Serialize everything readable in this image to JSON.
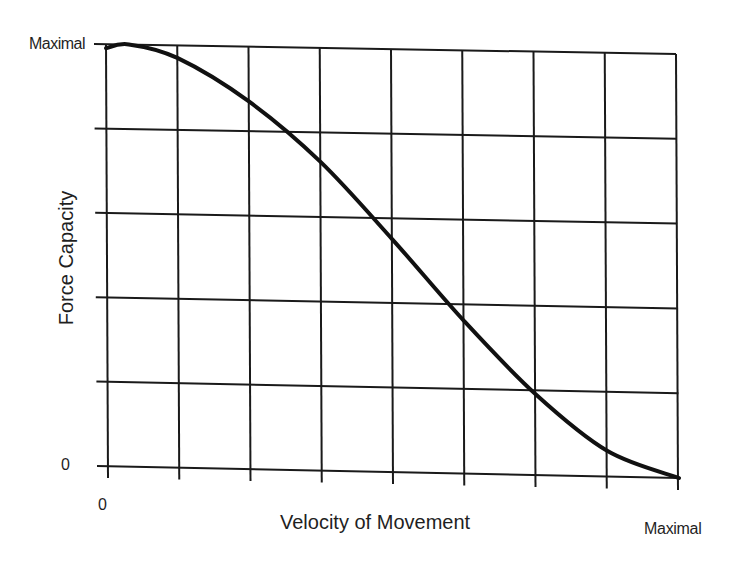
{
  "chart_data": {
    "type": "line",
    "title": "",
    "xlabel": "Velocity of Movement",
    "ylabel": "Force Capacity",
    "x_tick_labels": {
      "start": "0",
      "end": "Maximal"
    },
    "y_tick_labels": {
      "start": "0",
      "end": "Maximal"
    },
    "xlim": [
      0,
      1
    ],
    "ylim": [
      0,
      1
    ],
    "grid": true,
    "grid_divisions": {
      "x": 8,
      "y": 5
    },
    "legend": null,
    "series": [
      {
        "name": "Force-velocity relationship",
        "x": [
          0,
          0.125,
          0.25,
          0.375,
          0.5,
          0.625,
          0.75,
          0.875,
          1.0
        ],
        "values": [
          0.99,
          0.97,
          0.87,
          0.73,
          0.55,
          0.36,
          0.19,
          0.06,
          0.0
        ]
      }
    ],
    "line_color": "#111111",
    "grid_color": "#1a1a1a"
  },
  "labels": {
    "y_max": "Maximal",
    "y_zero": "0",
    "x_zero": "0",
    "x_max": "Maximal",
    "x_title": "Velocity of Movement",
    "y_title": "Force Capacity"
  }
}
